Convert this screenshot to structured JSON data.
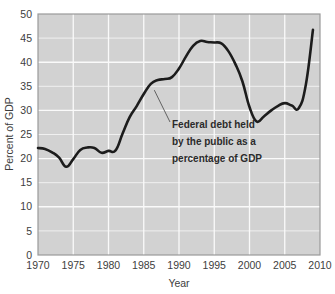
{
  "chart_data": {
    "type": "line",
    "title": "",
    "xlabel": "Year",
    "ylabel": "Percent of GDP",
    "xlim": [
      1970,
      2010
    ],
    "ylim": [
      0,
      50
    ],
    "grid": true,
    "legend": "none",
    "xticks": [
      "1970",
      "1975",
      "1980",
      "1985",
      "1990",
      "1995",
      "2000",
      "2005",
      "2010"
    ],
    "yticks": [
      "0",
      "5",
      "10",
      "15",
      "20",
      "25",
      "30",
      "35",
      "40",
      "45",
      "50"
    ],
    "series": [
      {
        "name": "Federal debt held by the public as a percentage of GDP",
        "color": "#1c1c1c",
        "x": [
          1970,
          1971,
          1972,
          1973,
          1974,
          1975,
          1976,
          1977,
          1978,
          1979,
          1980,
          1981,
          1982,
          1983,
          1984,
          1985,
          1986,
          1987,
          1988,
          1989,
          1990,
          1991,
          1992,
          1993,
          1994,
          1995,
          1996,
          1997,
          1998,
          1999,
          2000,
          2001,
          2002,
          2003,
          2004,
          2005,
          2006,
          2007,
          2008,
          2009
        ],
        "values": [
          22.2,
          22.0,
          21.3,
          20.2,
          18.3,
          19.9,
          21.8,
          22.3,
          22.2,
          21.2,
          21.6,
          21.7,
          25.2,
          28.6,
          30.9,
          33.4,
          35.5,
          36.3,
          36.5,
          36.9,
          38.7,
          41.2,
          43.4,
          44.4,
          44.2,
          44.1,
          43.9,
          42.3,
          39.6,
          36.0,
          30.7,
          27.7,
          28.7,
          29.9,
          30.9,
          31.5,
          31.0,
          30.5,
          35.4,
          46.7
        ]
      }
    ],
    "annotation": {
      "lines": [
        "Federal debt held",
        "by the public as a",
        "percentage of GDP"
      ],
      "leader_from_year": 1986.5,
      "leader_from_value": 34.2
    },
    "style": {
      "plot_background": "#d2d2d2",
      "gridline_color": "#f0f0f0",
      "major_gridline_color": "#fafafa",
      "plot_border": "#9a9a9a",
      "page_background": "#ffffff",
      "line_color": "#1c1c1c",
      "line_width": 2.6,
      "leader_color": "#555555"
    }
  },
  "axis": {
    "ylabel": "Percent of GDP",
    "xlabel": "Year"
  }
}
